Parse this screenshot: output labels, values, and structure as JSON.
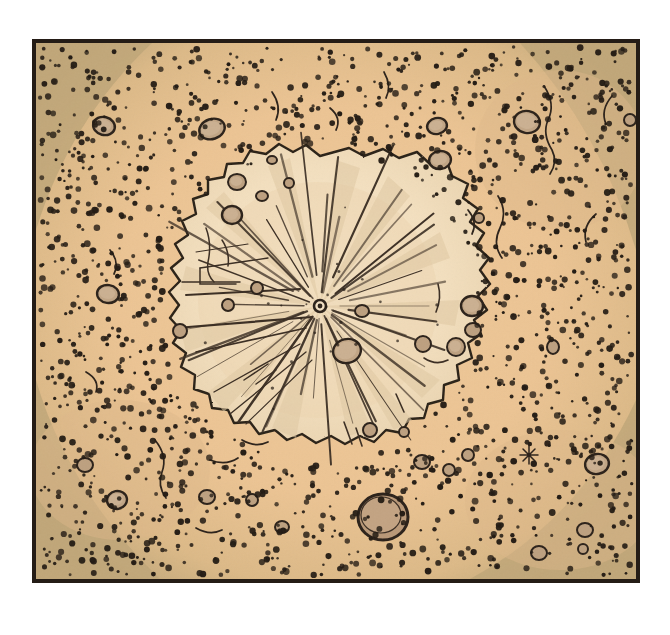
{
  "document": {
    "kind": "scientific-illustration",
    "subject": "Lunar impact crater with radial ray system",
    "medium": "pen-and-ink stipple drawing with watercolor wash",
    "page_background": "#ffffff"
  },
  "frame": {
    "label": "illustration-frame",
    "x": 34,
    "y": 41,
    "width": 604,
    "height": 540,
    "border_color": "#241c16",
    "border_width": 4
  },
  "palette": {
    "paper": "#ffffff",
    "regolith_light": "#edc694",
    "regolith_mid": "#e8bd87",
    "regolith_shadow": "#c7ac7e",
    "corner_shadow": "#bfa678",
    "ejecta_blanket": "#f2dcbb",
    "crater_floor": "#f7e6c9",
    "ray_wash": "#e2cca6",
    "ink": "#2b2119",
    "ink_soft": "#4a3c2e",
    "crater_fill": "#c1a585",
    "crater_fill_dark": "#b08f6d",
    "stipple": "#221a12"
  },
  "scene": {
    "terrain": {
      "name": "cratered regolith plain",
      "description": "Dense stippled dark dots representing rough pitted lunar surface",
      "stipple_dot_count": 1650,
      "stipple_dot_radius_range": [
        1.1,
        3.4
      ],
      "vignette_corners": [
        "top-left",
        "top-right",
        "bottom-left",
        "bottom-right"
      ]
    },
    "primary_crater": {
      "name": "central impact crater",
      "center": [
        320,
        306
      ],
      "ejecta_radius_x": 150,
      "ejecta_radius_y": 148,
      "rim_style": "irregular jagged ink outline",
      "floor_color": "#f7e6c9"
    },
    "impact_point": {
      "name": "impact-focus",
      "center": [
        320,
        306
      ],
      "outer_radius": 6,
      "inner_radius": 2.6
    },
    "ray_system": {
      "name": "radial ejecta rays",
      "count": 38,
      "description": "Fine straight ink lines radiating from impact focus, varying length and weight",
      "wedge_wash_count": 14
    },
    "large_crater": {
      "name": "prominent bowl crater",
      "center": [
        383,
        517
      ],
      "radius": 25,
      "fill": "#b99877"
    },
    "secondary_craters": [
      {
        "cx": 212,
        "cy": 129,
        "rx": 13,
        "ry": 10,
        "rot": -18
      },
      {
        "cx": 104,
        "cy": 126,
        "rx": 11,
        "ry": 9,
        "rot": 14
      },
      {
        "cx": 237,
        "cy": 182,
        "rx": 9,
        "ry": 8,
        "rot": 0
      },
      {
        "cx": 262,
        "cy": 196,
        "rx": 6,
        "ry": 5,
        "rot": 0
      },
      {
        "cx": 232,
        "cy": 215,
        "rx": 10,
        "ry": 9,
        "rot": 0
      },
      {
        "cx": 437,
        "cy": 126,
        "rx": 10,
        "ry": 8,
        "rot": -12
      },
      {
        "cx": 527,
        "cy": 122,
        "rx": 13,
        "ry": 11,
        "rot": 10
      },
      {
        "cx": 272,
        "cy": 160,
        "rx": 5,
        "ry": 4,
        "rot": 0
      },
      {
        "cx": 289,
        "cy": 183,
        "rx": 5,
        "ry": 5,
        "rot": 0
      },
      {
        "cx": 108,
        "cy": 294,
        "rx": 11,
        "ry": 9,
        "rot": 8
      },
      {
        "cx": 180,
        "cy": 331,
        "rx": 7,
        "ry": 7,
        "rot": 0
      },
      {
        "cx": 228,
        "cy": 305,
        "rx": 6,
        "ry": 6,
        "rot": 0
      },
      {
        "cx": 440,
        "cy": 160,
        "rx": 11,
        "ry": 9,
        "rot": -8
      },
      {
        "cx": 472,
        "cy": 306,
        "rx": 11,
        "ry": 10,
        "rot": 0
      },
      {
        "cx": 473,
        "cy": 330,
        "rx": 8,
        "ry": 7,
        "rot": 0
      },
      {
        "cx": 347,
        "cy": 351,
        "rx": 14,
        "ry": 12,
        "rot": -14
      },
      {
        "cx": 456,
        "cy": 347,
        "rx": 9,
        "ry": 9,
        "rot": 0
      },
      {
        "cx": 423,
        "cy": 344,
        "rx": 8,
        "ry": 8,
        "rot": 0
      },
      {
        "cx": 362,
        "cy": 311,
        "rx": 7,
        "ry": 6,
        "rot": 0
      },
      {
        "cx": 257,
        "cy": 288,
        "rx": 6,
        "ry": 6,
        "rot": 0
      },
      {
        "cx": 85,
        "cy": 465,
        "rx": 8,
        "ry": 7,
        "rot": 0
      },
      {
        "cx": 117,
        "cy": 500,
        "rx": 10,
        "ry": 9,
        "rot": -10
      },
      {
        "cx": 207,
        "cy": 497,
        "rx": 8,
        "ry": 7,
        "rot": 0
      },
      {
        "cx": 422,
        "cy": 462,
        "rx": 8,
        "ry": 7,
        "rot": 0
      },
      {
        "cx": 449,
        "cy": 470,
        "rx": 6,
        "ry": 6,
        "rot": 0
      },
      {
        "cx": 468,
        "cy": 455,
        "rx": 6,
        "ry": 6,
        "rot": 0
      },
      {
        "cx": 597,
        "cy": 464,
        "rx": 12,
        "ry": 10,
        "rot": -12
      },
      {
        "cx": 585,
        "cy": 530,
        "rx": 8,
        "ry": 7,
        "rot": 0
      },
      {
        "cx": 539,
        "cy": 553,
        "rx": 8,
        "ry": 7,
        "rot": 0
      },
      {
        "cx": 583,
        "cy": 549,
        "rx": 5,
        "ry": 5,
        "rot": 0
      },
      {
        "cx": 282,
        "cy": 527,
        "rx": 7,
        "ry": 6,
        "rot": 0
      },
      {
        "cx": 252,
        "cy": 500,
        "rx": 6,
        "ry": 6,
        "rot": 0
      },
      {
        "cx": 553,
        "cy": 347,
        "rx": 6,
        "ry": 7,
        "rot": 0
      },
      {
        "cx": 479,
        "cy": 218,
        "rx": 5,
        "ry": 5,
        "rot": 0
      },
      {
        "cx": 370,
        "cy": 430,
        "rx": 7,
        "ry": 7,
        "rot": 0
      },
      {
        "cx": 404,
        "cy": 432,
        "rx": 5,
        "ry": 5,
        "rot": 0
      },
      {
        "cx": 630,
        "cy": 120,
        "rx": 6,
        "ry": 6,
        "rot": 0
      }
    ],
    "rille_marks": {
      "name": "surface fissures and scratch marks",
      "count": 14,
      "description": "Thin wandering ink lines across the regolith outside the crater"
    },
    "star_burst_mark": {
      "cx": 529,
      "cy": 455,
      "size": 9
    }
  },
  "chart_data": {
    "type": "scatter",
    "xlabel": "",
    "ylabel": "",
    "categories": [
      "regolith stipple field",
      "ejecta blanket",
      "crater floor",
      "radial rays",
      "secondary craters",
      "prominent bowl crater"
    ],
    "values": [
      1650,
      1,
      1,
      38,
      37,
      1
    ],
    "grid": false,
    "legend": "none"
  }
}
